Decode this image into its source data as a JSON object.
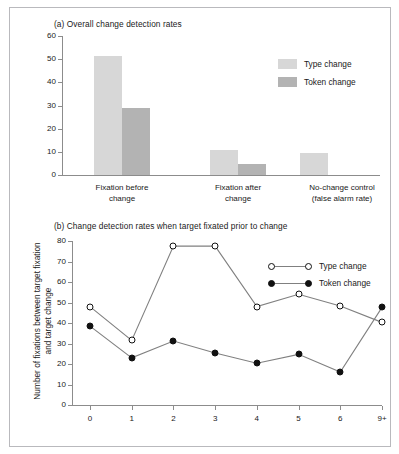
{
  "figure": {
    "panels": [
      {
        "id": "panel-a",
        "title": "(a) Overall change detection rates"
      },
      {
        "id": "panel-b",
        "title": "(b) Change detection rates when target fixated prior to change"
      }
    ]
  },
  "chart_data": [
    {
      "type": "bar",
      "title": "(a) Overall change detection rates",
      "xlabel": "",
      "ylabel": "",
      "ylim": [
        0,
        60
      ],
      "yticks": [
        0,
        10,
        20,
        30,
        40,
        50,
        60
      ],
      "ytick_labels": [
        "0",
        "10",
        "20",
        "30",
        "40",
        "50",
        "60"
      ],
      "grid": false,
      "legend_position": "upper-right",
      "categories": [
        "Fixation before\nchange",
        "Fixation after\nchange",
        "No-change control\n(false alarm rate)"
      ],
      "category_lines": [
        [
          "Fixation before",
          "change"
        ],
        [
          "Fixation after",
          "change"
        ],
        [
          "No-change control",
          "(false alarm rate)"
        ]
      ],
      "series": [
        {
          "name": "Type change",
          "color": "#d7d7d7",
          "values": [
            51.5,
            10.7,
            9.3
          ]
        },
        {
          "name": "Token change",
          "color": "#b3b3b3",
          "values": [
            28.8,
            4.9,
            0
          ]
        }
      ]
    },
    {
      "type": "line",
      "title": "(b) Change detection rates when target fixated prior to change",
      "xlabel": "",
      "ylabel": "Number of fixations between target fixation and target change",
      "ylabel_lines": [
        "Number of fixations between target fixation",
        "and target change"
      ],
      "ylim": [
        0,
        80
      ],
      "yticks": [
        0,
        10,
        20,
        30,
        40,
        50,
        60,
        70,
        80
      ],
      "ytick_labels": [
        "0",
        "10",
        "20",
        "30",
        "40",
        "50",
        "60",
        "70",
        "80"
      ],
      "grid": false,
      "legend_position": "upper-right",
      "x": [
        "0",
        "1",
        "2",
        "3",
        "4",
        "5",
        "6",
        "9+"
      ],
      "series": [
        {
          "name": "Type change",
          "marker": "open-circle",
          "color": "#808080",
          "values": [
            48,
            31.5,
            77.5,
            77.5,
            48,
            54,
            48.3,
            40.3
          ]
        },
        {
          "name": "Token change",
          "marker": "filled-circle",
          "color": "#808080",
          "values": [
            38.5,
            23,
            31.2,
            25.4,
            20.4,
            24.7,
            16.1,
            47.6
          ]
        }
      ]
    }
  ]
}
